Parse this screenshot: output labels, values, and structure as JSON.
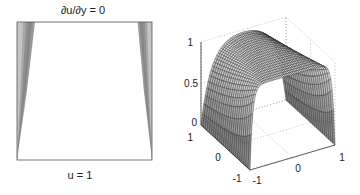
{
  "chart_data": [
    {
      "type": "heatmap",
      "description": "2D domain view of solution u on square",
      "top_label": "∂u/∂y = 0",
      "bottom_label": "u = 1",
      "xlim": [
        -1,
        1
      ],
      "ylim": [
        -1,
        1
      ],
      "boundary_layers": [
        "left",
        "right"
      ]
    },
    {
      "type": "surface",
      "title": "",
      "xlim": [
        -1,
        1
      ],
      "ylim": [
        -1,
        1
      ],
      "zlim": [
        0,
        1
      ],
      "x_ticks": [
        "-1",
        "0",
        "1"
      ],
      "y_ticks": [
        "-1",
        "0",
        "1"
      ],
      "z_ticks": [
        "0",
        "0.5",
        "1"
      ],
      "grid": "dotted",
      "surface_max": 1,
      "surface_min": 0,
      "grid_resolution": [
        60,
        24
      ]
    }
  ]
}
